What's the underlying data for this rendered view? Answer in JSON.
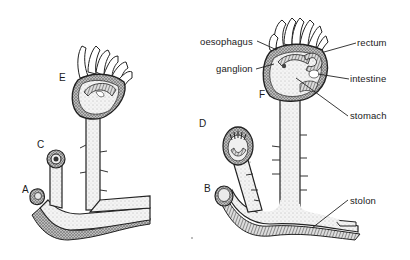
{
  "figure": {
    "stage_labels": [
      {
        "id": "A",
        "text": "A"
      },
      {
        "id": "B",
        "text": "B"
      },
      {
        "id": "C",
        "text": "C"
      },
      {
        "id": "D",
        "text": "D"
      },
      {
        "id": "E",
        "text": "E"
      },
      {
        "id": "F",
        "text": "F"
      }
    ],
    "anatomy_labels": [
      {
        "id": "oesophagus",
        "text": "oesophagus"
      },
      {
        "id": "ganglion",
        "text": "ganglion"
      },
      {
        "id": "rectum",
        "text": "rectum"
      },
      {
        "id": "intestine",
        "text": "intestine"
      },
      {
        "id": "stomach",
        "text": "stomach"
      },
      {
        "id": "stolon",
        "text": "stolon"
      }
    ],
    "colors": {
      "ink": "#1a1a1a",
      "stipple_fill": "#e6e6e6",
      "dark_fill": "#555555",
      "background": "#ffffff"
    }
  }
}
